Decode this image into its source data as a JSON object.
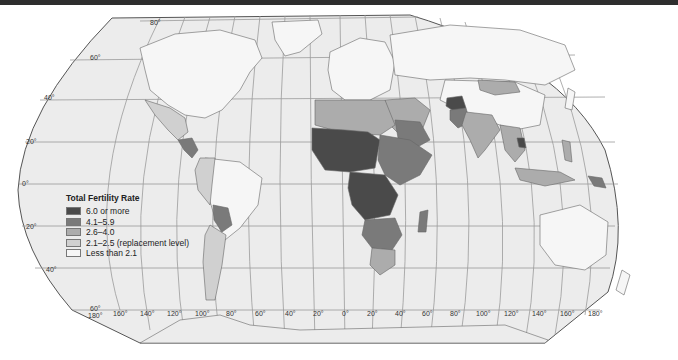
{
  "map": {
    "title": "Total Fertility Rate",
    "projection": "Robinson-like world projection",
    "legend": {
      "title": "Total Fertility Rate",
      "items": [
        {
          "label": "6.0 or more",
          "color": "#4a4a4a"
        },
        {
          "label": "4.1–5.9",
          "color": "#7a7a7a"
        },
        {
          "label": "2.6–4.0",
          "color": "#acacac"
        },
        {
          "label": "2.1–2.5 (replacement level)",
          "color": "#d0d0d0"
        },
        {
          "label": "Less than 2.1",
          "color": "#f6f6f6"
        }
      ]
    },
    "latitude_labels": [
      "80°",
      "60°",
      "40°",
      "20°",
      "0°",
      "20°",
      "40°",
      "60°"
    ],
    "longitude_labels": [
      "180°",
      "160°",
      "140°",
      "120°",
      "100°",
      "80°",
      "60°",
      "40°",
      "20°",
      "0°",
      "20°",
      "40°",
      "60°",
      "80°",
      "100°",
      "120°",
      "140°",
      "160°",
      "180°"
    ],
    "colors": {
      "ocean": "#ececec",
      "frame_stroke": "#555555",
      "graticule": "#9a9a9a",
      "top_bar": "#2e2e2e"
    }
  }
}
